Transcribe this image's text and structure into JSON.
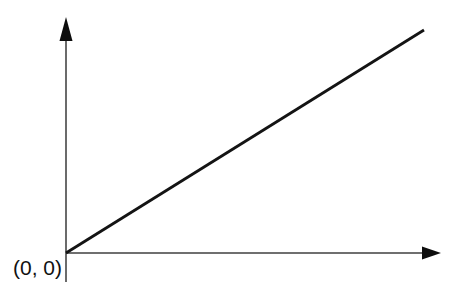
{
  "figure": {
    "title": "",
    "background_color": "#ffffff",
    "width": 456,
    "height": 298
  },
  "labels": {
    "origin": "(0, 0)"
  },
  "chart_data": {
    "type": "line",
    "title": "",
    "xlabel": "",
    "ylabel": "",
    "grid": false,
    "legend": false,
    "axes": {
      "origin_px": [
        66,
        253
      ],
      "x_axis": {
        "start_px": [
          66,
          253
        ],
        "end_px": [
          440,
          253
        ],
        "arrow": "right",
        "color": "#3f3f3f",
        "width_px": 1.6,
        "ticks": [],
        "tick_labels": []
      },
      "y_axis": {
        "start_px": [
          66,
          282
        ],
        "end_px": [
          66,
          20
        ],
        "arrow": "up",
        "color": "#6b6b6b",
        "width_px": 2,
        "ticks": [],
        "tick_labels": []
      }
    },
    "series": [
      {
        "name": "proportional-line",
        "color": "#141414",
        "width_px": 2.8,
        "points_px": [
          [
            66,
            253
          ],
          [
            424,
            30
          ]
        ],
        "x": [
          0,
          1
        ],
        "values": [
          0,
          1
        ],
        "description": "Straight line of constant positive slope through the origin"
      }
    ],
    "annotations": [
      {
        "text": "(0, 0)",
        "position_px": [
          13,
          256
        ],
        "target_px": [
          66,
          253
        ],
        "role": "origin-label"
      }
    ]
  }
}
